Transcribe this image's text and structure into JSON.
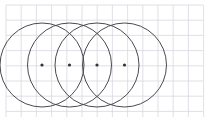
{
  "figure": {
    "canvas": {
      "width": 209,
      "height": 122
    },
    "background_color": "#ffffff"
  },
  "grid": {
    "visible": true,
    "spacing": 15.2,
    "line_color": "#d8d8e0",
    "line_width": 0.8,
    "origin_x": 6,
    "origin_y": 5,
    "area": {
      "x": 6,
      "y": 5,
      "width": 197,
      "height": 112
    },
    "vertical_lines": [
      6,
      21.2,
      36.4,
      51.6,
      66.8,
      82,
      97.2,
      112.4,
      127.6,
      142.8,
      158,
      173.2,
      188.4,
      203.6
    ],
    "horizontal_lines": [
      5,
      20.2,
      35.4,
      50.6,
      65.8,
      81,
      96.2,
      111.4
    ]
  },
  "circles": {
    "count": 4,
    "radius": 42,
    "stroke_color": "#4a4a50",
    "stroke_width": 1,
    "fill": "none",
    "center_y": 65,
    "items": [
      {
        "label": "circle-1",
        "cx": 42,
        "cy": 65,
        "r": 42
      },
      {
        "label": "circle-2",
        "cx": 69.5,
        "cy": 65,
        "r": 42
      },
      {
        "label": "circle-3",
        "cx": 97,
        "cy": 65,
        "r": 42
      },
      {
        "label": "circle-4",
        "cx": 124.5,
        "cy": 65,
        "r": 42
      }
    ]
  },
  "center_dots": {
    "radius": 1.6,
    "color": "#333338",
    "items": [
      {
        "label": "center-dot-1",
        "cx": 42,
        "cy": 65
      },
      {
        "label": "center-dot-2",
        "cx": 69.5,
        "cy": 65
      },
      {
        "label": "center-dot-3",
        "cx": 97,
        "cy": 65
      },
      {
        "label": "center-dot-4",
        "cx": 124.5,
        "cy": 65
      }
    ]
  }
}
